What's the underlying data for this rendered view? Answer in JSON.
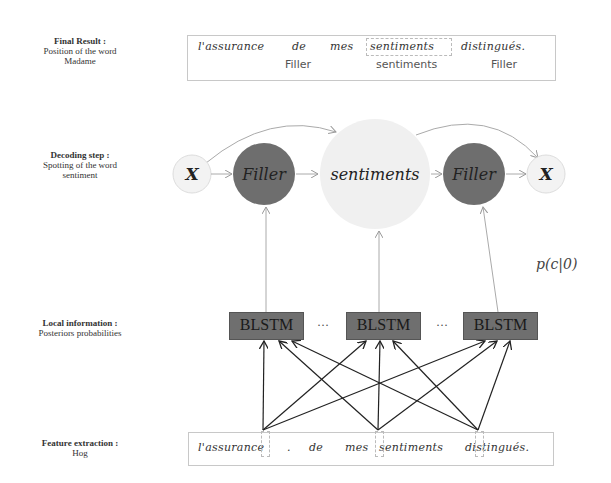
{
  "labels": {
    "final": {
      "title": "Final Result :",
      "line1": "Position of the word",
      "line2": "Madame"
    },
    "decoding": {
      "title": "Decoding step :",
      "line1": "Spotting of the word",
      "line2": "sentiment"
    },
    "local": {
      "title": "Local information :",
      "line1": "Posteriors probabilities"
    },
    "feature": {
      "title": "Feature extraction :",
      "line1": "Hog"
    }
  },
  "result_box": {
    "words": [
      "l'assurance",
      "de",
      "mes",
      "sentiments",
      "distingués."
    ],
    "tags": [
      "Filler",
      "sentiments",
      "Filler"
    ]
  },
  "decoding": {
    "nodes": [
      {
        "id": "x-start",
        "label": "X"
      },
      {
        "id": "filler-1",
        "label": "Filler"
      },
      {
        "id": "keyword",
        "label": "sentiments"
      },
      {
        "id": "filler-2",
        "label": "Filler"
      },
      {
        "id": "x-end",
        "label": "X"
      }
    ]
  },
  "probability_label": "p(c|0)",
  "blstm": {
    "label": "BLSTM",
    "ellipsis": "···"
  },
  "feature_box": {
    "words": [
      "l'assurance",
      ".",
      "de",
      "mes",
      "sentiments",
      "distingués."
    ]
  },
  "colors": {
    "filler_fill": "#6e6e6e",
    "keyword_fill": "#efefef",
    "x_fill": "#f2f2f2",
    "blstm_fill": "#6f6f6f",
    "arrow_light": "#999999",
    "arrow_dark": "#222222"
  }
}
